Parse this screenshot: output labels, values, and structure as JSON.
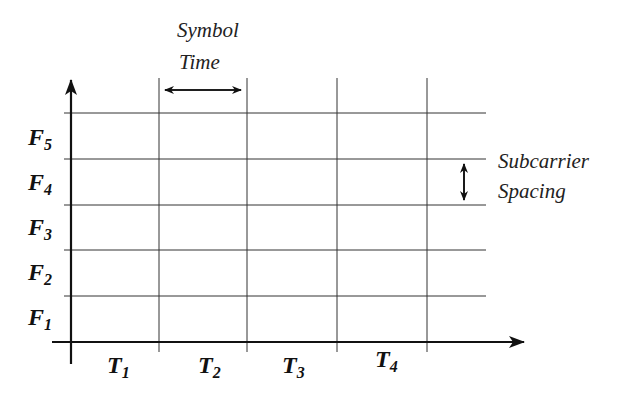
{
  "diagram": {
    "annotations": {
      "symbol_time": [
        "Symbol",
        "Time"
      ],
      "subcarrier_spacing": [
        "Subcarrier",
        "Spacing"
      ]
    },
    "y_axis": {
      "labels": [
        {
          "base": "F",
          "sub": "5"
        },
        {
          "base": "F",
          "sub": "4"
        },
        {
          "base": "F",
          "sub": "3"
        },
        {
          "base": "F",
          "sub": "2"
        },
        {
          "base": "F",
          "sub": "1"
        }
      ]
    },
    "x_axis": {
      "labels": [
        {
          "base": "T",
          "sub": "1"
        },
        {
          "base": "T",
          "sub": "2"
        },
        {
          "base": "T",
          "sub": "3"
        },
        {
          "base": "T",
          "sub": "4"
        }
      ]
    },
    "colors": {
      "line": "#222222",
      "text": "#111111",
      "background": "#ffffff"
    }
  }
}
